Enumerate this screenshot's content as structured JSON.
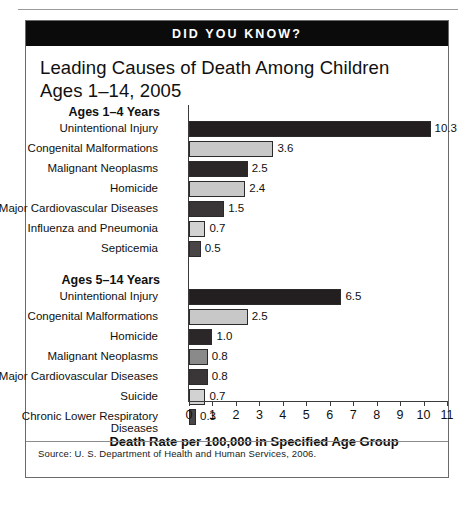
{
  "banner": {
    "label": "DID YOU KNOW?"
  },
  "title": "Leading Causes of Death Among Children Ages 1–14, 2005",
  "axis_caption": "Death Rate per 100,000 in Specified Age Group",
  "source": "Source: U. S. Department of Health and Human Services, 2006.",
  "colors": {
    "banner_background": "#0b0b0b",
    "banner_text": "#ffffff",
    "bar_dark": "#231f20",
    "bar_light": "#c8c8c8",
    "bar_medium": "#8a8a8a",
    "frame": "#6b6b6b",
    "page_background": "#ffffff"
  },
  "chart_data": {
    "type": "bar",
    "orientation": "horizontal",
    "title": "Leading Causes of Death Among Children Ages 1–14, 2005",
    "xlabel": "Death Rate per 100,000 in Specified Age Group",
    "ylabel": "",
    "xlim": [
      0,
      11
    ],
    "xticks": [
      "0",
      "1",
      "2",
      "3",
      "4",
      "5",
      "6",
      "7",
      "8",
      "9",
      "10",
      "11"
    ],
    "grid": false,
    "legend": "none",
    "groups": [
      {
        "heading": "Ages 1–4 Years",
        "categories": [
          "Unintentional Injury",
          "Congenital Malformations",
          "Malignant Neoplasms",
          "Homicide",
          "Major Cardiovascular Diseases",
          "Influenza and Pneumonia",
          "Septicemia"
        ],
        "values": [
          10.3,
          3.6,
          2.5,
          2.4,
          1.5,
          0.7,
          0.5
        ],
        "labels": [
          "10.3",
          "3.6",
          "2.5",
          "2.4",
          "1.5",
          "0.7",
          "0.5"
        ],
        "bar_colors": [
          "#231f20",
          "#c8c8c8",
          "#2b2728",
          "#c8c8c8",
          "#3a3637",
          "#d2d2d2",
          "#4a4647"
        ]
      },
      {
        "heading": "Ages 5–14 Years",
        "categories": [
          "Unintentional Injury",
          "Congenital Malformations",
          "Homicide",
          "Malignant Neoplasms",
          "Major Cardiovascular Diseases",
          "Suicide",
          "Chronic Lower Respiratory Diseases"
        ],
        "values": [
          6.5,
          2.5,
          1.0,
          0.8,
          0.8,
          0.7,
          0.3
        ],
        "labels": [
          "6.5",
          "2.5",
          "1.0",
          "0.8",
          "0.8",
          "0.7",
          "0.3"
        ],
        "bar_colors": [
          "#231f20",
          "#c8c8c8",
          "#2b2728",
          "#8a8a8a",
          "#3a3637",
          "#d2d2d2",
          "#4a4647"
        ]
      }
    ]
  }
}
